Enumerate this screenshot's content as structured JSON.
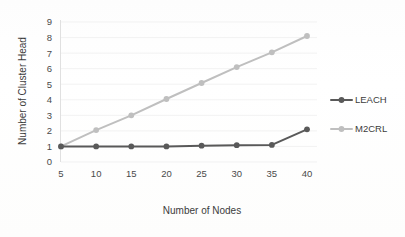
{
  "chart_data": {
    "type": "line",
    "title": "",
    "xlabel": "Number of Nodes",
    "ylabel": "Number of Cluster Head",
    "categories": [
      5,
      10,
      15,
      20,
      25,
      30,
      35,
      40
    ],
    "x_tick_labels": [
      "5",
      "10",
      "15",
      "20",
      "25",
      "30",
      "35",
      "40"
    ],
    "y_tick_labels": [
      "0",
      "1",
      "2",
      "3",
      "4",
      "5",
      "6",
      "7",
      "8",
      "9"
    ],
    "ylim": [
      0,
      9
    ],
    "y_step": 1,
    "grid": "horizontal",
    "legend_position": "right",
    "series": [
      {
        "name": "LEACH",
        "color": "#595959",
        "marker": "circle",
        "values": [
          1,
          1,
          1,
          1,
          1.05,
          1.08,
          1.1,
          2.1
        ]
      },
      {
        "name": "M2CRL",
        "color": "#bfbfbf",
        "marker": "circle",
        "values": [
          1,
          2.05,
          3.0,
          4.05,
          5.08,
          6.1,
          7.05,
          8.1
        ]
      }
    ]
  },
  "legend": {
    "entries": [
      {
        "label": "LEACH",
        "color": "#595959"
      },
      {
        "label": "M2CRL",
        "color": "#bfbfbf"
      }
    ]
  },
  "axes": {
    "x_title": "Number of Nodes",
    "y_title": "Number of Cluster Head"
  }
}
